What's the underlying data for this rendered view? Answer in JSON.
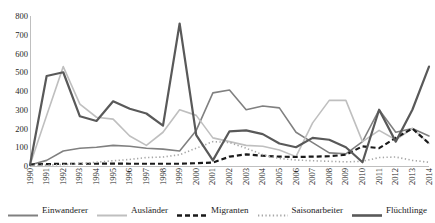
{
  "chart_data": {
    "type": "line",
    "title": "",
    "xlabel": "",
    "ylabel": "",
    "ylim": [
      0,
      800
    ],
    "yticks": [
      800,
      700,
      600,
      500,
      400,
      300,
      200,
      100,
      0
    ],
    "grid": false,
    "legend_position": "bottom",
    "categories": [
      "1990",
      "1991",
      "1992",
      "1993",
      "1994",
      "1995",
      "1996",
      "1997",
      "1998",
      "1999",
      "2000",
      "2001",
      "2002",
      "2003",
      "2004",
      "2005",
      "2006",
      "2007",
      "2008",
      "2009",
      "2010",
      "2011",
      "2012",
      "2013",
      "2014"
    ],
    "series": [
      {
        "name": "Einwanderer",
        "style": "solid-medium-gray",
        "color": "#808080",
        "values": [
          5,
          30,
          80,
          95,
          100,
          110,
          105,
          95,
          90,
          80,
          190,
          390,
          405,
          300,
          320,
          310,
          180,
          125,
          70,
          65,
          130,
          300,
          180,
          200,
          160
        ]
      },
      {
        "name": "Ausländer",
        "style": "solid-light-gray",
        "color": "#bfbfbf",
        "values": [
          5,
          270,
          530,
          330,
          260,
          250,
          160,
          110,
          180,
          300,
          270,
          150,
          130,
          110,
          105,
          85,
          50,
          230,
          350,
          350,
          130,
          190,
          140,
          200,
          120
        ]
      },
      {
        "name": "Migranten",
        "style": "dashed-black",
        "color": "#1a1a1a",
        "values": [
          8,
          10,
          12,
          12,
          12,
          13,
          12,
          12,
          12,
          12,
          15,
          18,
          50,
          62,
          55,
          50,
          48,
          50,
          52,
          60,
          105,
          95,
          150,
          200,
          120
        ]
      },
      {
        "name": "Saisonarbeiter",
        "style": "dotted-gray",
        "color": "#a6a6a6",
        "values": [
          3,
          5,
          8,
          12,
          20,
          28,
          35,
          45,
          48,
          60,
          95,
          130,
          125,
          95,
          60,
          40,
          32,
          28,
          25,
          22,
          25,
          45,
          48,
          30,
          20
        ]
      },
      {
        "name": "Flüchtlinge",
        "style": "solid-dark-thick",
        "color": "#595959",
        "values": [
          5,
          480,
          500,
          265,
          240,
          345,
          305,
          280,
          215,
          760,
          165,
          30,
          185,
          190,
          170,
          120,
          100,
          150,
          140,
          100,
          20,
          300,
          130,
          300,
          530
        ]
      }
    ]
  },
  "legend": {
    "items": [
      {
        "label": "Einwanderer",
        "swatch": "swatch-solid-medium"
      },
      {
        "label": "Ausländer",
        "swatch": "swatch-solid-light"
      },
      {
        "label": "Migranten",
        "swatch": "swatch-dashed"
      },
      {
        "label": "Saisonarbeiter",
        "swatch": "swatch-dotted"
      },
      {
        "label": "Flüchtlinge",
        "swatch": "swatch-solid-dark"
      }
    ]
  },
  "colors": {
    "einwanderer": "#808080",
    "auslaender": "#bfbfbf",
    "migranten": "#1a1a1a",
    "saisonarbeiter": "#a6a6a6",
    "fluechtlinge": "#595959",
    "axis": "#bfbfbf",
    "text": "#1a1a1a"
  }
}
